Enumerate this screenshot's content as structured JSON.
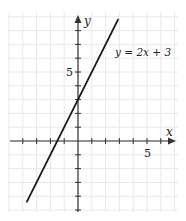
{
  "chart_data": {
    "type": "line",
    "title": "",
    "xlabel": "x",
    "ylabel": "y",
    "xlim": [
      -5,
      6
    ],
    "ylim": [
      -5,
      9
    ],
    "grid": true,
    "x_tick_labels": [
      {
        "value": 5,
        "label": "5"
      }
    ],
    "y_tick_labels": [
      {
        "value": 5,
        "label": "5"
      }
    ],
    "series": [
      {
        "name": "y = 2x + 3",
        "equation": {
          "slope": 2,
          "intercept": 3
        },
        "x": [
          -3.7,
          2.9
        ],
        "y": [
          -4.4,
          8.8
        ]
      }
    ],
    "annotations": [
      {
        "text": "y = 2x + 3",
        "x": 3.1,
        "y": 7.2
      }
    ]
  },
  "labels": {
    "x_axis": "x",
    "y_axis": "y",
    "x_tick_5": "5",
    "y_tick_5": "5",
    "equation": "y = 2x + 3"
  },
  "colors": {
    "line": "#1a1a1a",
    "axis": "#333333",
    "grid": "#e8e8e8"
  }
}
